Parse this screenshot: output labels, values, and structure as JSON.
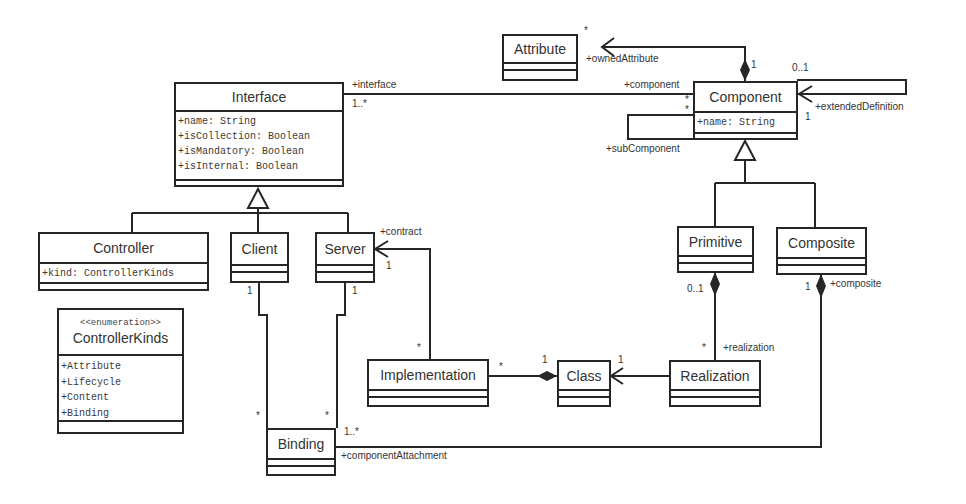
{
  "diagram": {
    "type": "UML class diagram",
    "classes": {
      "attribute": {
        "name": "Attribute",
        "attributes": []
      },
      "interface": {
        "name": "Interface",
        "attributes": [
          "+name: String",
          "+isCollection: Boolean",
          "+isMandatory: Boolean",
          "+isInternal: Boolean"
        ]
      },
      "component": {
        "name": "Component",
        "attributes": [
          "+name: String"
        ]
      },
      "controller": {
        "name": "Controller",
        "attributes": [
          "+kind: ControllerKinds"
        ]
      },
      "client": {
        "name": "Client",
        "attributes": []
      },
      "server": {
        "name": "Server",
        "attributes": []
      },
      "controller_kinds": {
        "stereotype": "<<enumeration>>",
        "name": "ControllerKinds",
        "literals": [
          "+Attribute",
          "+Lifecycle",
          "+Content",
          "+Binding"
        ]
      },
      "primitive": {
        "name": "Primitive",
        "attributes": []
      },
      "composite": {
        "name": "Composite",
        "attributes": []
      },
      "implementation": {
        "name": "Implementation",
        "attributes": []
      },
      "class": {
        "name": "Class",
        "attributes": []
      },
      "realization": {
        "name": "Realization",
        "attributes": []
      },
      "binding": {
        "name": "Binding",
        "attributes": []
      }
    },
    "labels": {
      "owned_attribute_role": "+ownedAttribute",
      "owned_attribute_mult": "*",
      "owned_attribute_owner_mult": "1",
      "interface_role": "+interface",
      "interface_mult": "1..*",
      "component_role": "+component",
      "component_mult_1": "*",
      "component_mult_2": "*",
      "sub_component_role": "+subComponent",
      "extended_def_role": "+extendedDefinition",
      "extended_def_mult_top": "0..1",
      "extended_def_mult_bottom": "1",
      "contract_role": "+contract",
      "contract_mult": "1",
      "impl_contract_mult": "*",
      "client_mult": "1",
      "server_mult": "1",
      "binding_client_mult": "*",
      "binding_server_mult": "*",
      "binding_comp_mult": "1..*",
      "component_attachment_role": "+componentAttachment",
      "impl_class_mult": "*",
      "class_impl_mult": "1",
      "class_real_mult": "1",
      "primitive_mult": "0..1",
      "realization_mult": "*",
      "realization_role": "+realization",
      "composite_mult": "1",
      "composite_role": "+composite"
    }
  }
}
